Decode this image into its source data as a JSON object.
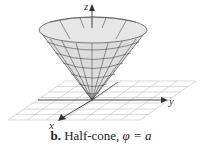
{
  "figure": {
    "label": "b.",
    "caption": "Half-cone, ",
    "equation": "φ = a",
    "axes": {
      "x": "x",
      "y": "y",
      "z": "z"
    },
    "colors": {
      "surface": "#d8d8d8",
      "mesh": "#333333",
      "grid": "#c8c8c8",
      "axis": "#444444"
    }
  }
}
